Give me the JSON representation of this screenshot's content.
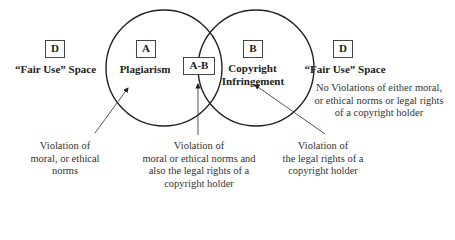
{
  "regions": {
    "d_left": {
      "letter": "D",
      "label": "“Fair Use” Space"
    },
    "a": {
      "letter": "A",
      "label": "Plagiarism"
    },
    "ab": {
      "letter": "A-B"
    },
    "b": {
      "letter": "B",
      "label_line1": "Copyright",
      "label_line2": "Infringement"
    },
    "d_right": {
      "letter": "D",
      "label": "“Fair Use” Space",
      "desc": [
        "No Violations of either moral,",
        "or ethical norms or legal rights",
        "of a copyright holder"
      ]
    }
  },
  "annotations": {
    "a_note": [
      "Violation of",
      "moral, or ethical",
      "norms"
    ],
    "ab_note": [
      "Violation of",
      "moral or ethical norms and",
      "also the legal rights of a",
      "copyright holder"
    ],
    "b_note": [
      "Violation of",
      "the legal rights of a",
      "copyright holder"
    ]
  },
  "colors": {
    "stroke": "#222222",
    "text": "#222222"
  }
}
